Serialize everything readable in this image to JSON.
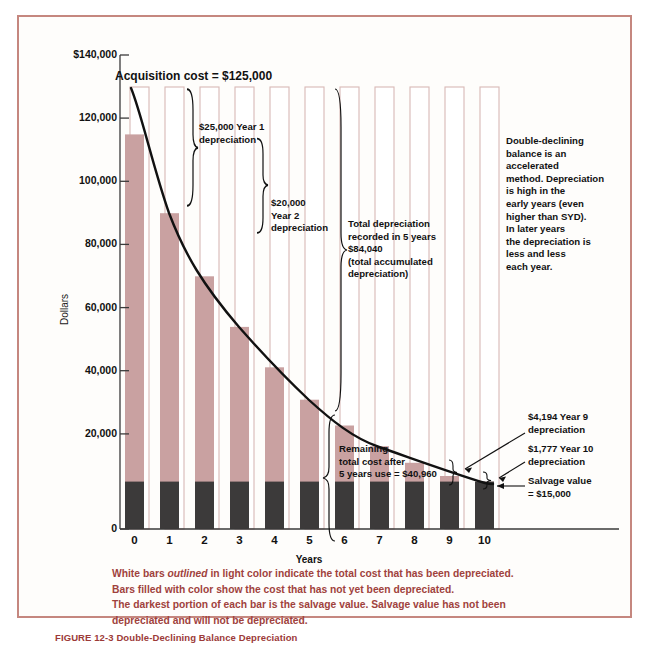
{
  "figure": {
    "caption_number": "FIGURE 12-3",
    "caption_title": "Double-Declining Balance Depreciation"
  },
  "chart_data": {
    "type": "bar",
    "title": "",
    "xlabel": "Years",
    "ylabel": "Dollars",
    "categories": [
      "0",
      "1",
      "2",
      "3",
      "4",
      "5",
      "6",
      "7",
      "8",
      "9",
      "10"
    ],
    "ylim": [
      0,
      140000
    ],
    "yticks": [
      0,
      20000,
      40000,
      60000,
      80000,
      100000,
      120000,
      140000
    ],
    "ytick_labels": [
      "0",
      "20,000",
      "40,000",
      "60,000",
      "80,000",
      "100,000",
      "120,000",
      "$140,000"
    ],
    "grid": false,
    "legend_position": "below-axis",
    "series": [
      {
        "name": "Remaining book value (filled with color — cost not yet depreciated)",
        "color": "#c9a1a1",
        "values": [
          125000,
          100000,
          80000,
          64000,
          51200,
          40960,
          32768,
          26214,
          20972,
          16777,
          15000
        ]
      },
      {
        "name": "Salvage value (darkest portion of each bar)",
        "color": "#3c3a3a",
        "values": [
          15000,
          15000,
          15000,
          15000,
          15000,
          15000,
          15000,
          15000,
          15000,
          15000,
          15000
        ]
      },
      {
        "name": "Depreciated to date (white bar outlined in light color)",
        "color": "#ffffff",
        "outline": "#d8b9b6",
        "values": [
          0,
          25000,
          45000,
          61000,
          73800,
          84040,
          92232,
          98786,
          104028,
          108223,
          110000
        ]
      }
    ],
    "book_value_curve": [
      125000,
      100000,
      80000,
      64000,
      51200,
      40960,
      32768,
      26214,
      20972,
      16777,
      15000
    ],
    "annotations": [
      {
        "id": "acquisition-cost",
        "text": "Acquisition cost = $125,000"
      },
      {
        "id": "year1-depreciation",
        "text": "$25,000 Year 1\ndepreciation"
      },
      {
        "id": "year2-depreciation",
        "text": "$20,000\nYear 2\ndepreciation"
      },
      {
        "id": "total-depreciation-5yr",
        "text": "Total depreciation\nrecorded in 5 years\n$84,040\n(total accumulated\ndepreciation)"
      },
      {
        "id": "method-note",
        "text": "Double-declining\nbalance is an\naccelerated\nmethod.  Depreciation\nis high in the\nearly years (even\nhigher than SYD).\nIn later years\nthe depreciation is\nless and less\neach year."
      },
      {
        "id": "remaining-cost",
        "text": "Remaining\ntotal cost  after\n5 years use  =  $40,960"
      },
      {
        "id": "year9-depreciation",
        "text": "$4,194 Year 9\ndepreciation"
      },
      {
        "id": "year10-depreciation",
        "text": "$1,777 Year 10\ndepreciation"
      },
      {
        "id": "salvage-value",
        "text": "Salvage value\n= $15,000"
      }
    ],
    "footnote_lines": [
      "White bars outlined in light color indicate the total cost that has been depreciated.",
      "Bars filled with color show the cost that has not yet been depreciated.",
      "The darkest portion of each bar is the salvage value. Salvage value has not been",
      "depreciated and will not be depreciated."
    ],
    "footnote_italic_word": "outlined",
    "colors": {
      "fill": "#c9a1a1",
      "salvage": "#3c3a3a",
      "outline": "#d8b9b6",
      "curve": "#000000",
      "frame": "#c5877f",
      "caption": "#9c3a38"
    }
  }
}
